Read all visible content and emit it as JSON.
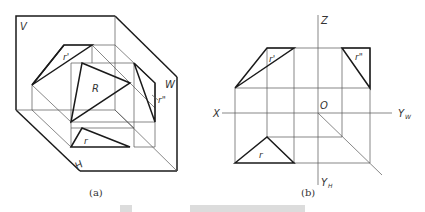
{
  "figure": {
    "panels": [
      {
        "id": "a",
        "caption": "(a)",
        "description": "Pictorial view of three projection planes with a plane R and its projections",
        "labels": {
          "v_plane": "V",
          "w_plane": "W",
          "h_plane": "H",
          "surface": "R",
          "front_projection": "r'",
          "side_projection": "r\"",
          "top_projection": "r"
        }
      },
      {
        "id": "b",
        "caption": "(b)",
        "description": "Orthographic three-view projection of plane R",
        "labels": {
          "x_axis": "X",
          "z_axis": "Z",
          "origin": "O",
          "yw_axis": "Y",
          "yw_sub": "W",
          "yh_axis": "Y",
          "yh_sub": "H",
          "front_projection": "r'",
          "side_projection": "r\"",
          "top_projection": "r"
        }
      }
    ],
    "colors": {
      "line": "#1a1a1a",
      "construction": "#555555",
      "background": "#ffffff"
    }
  }
}
